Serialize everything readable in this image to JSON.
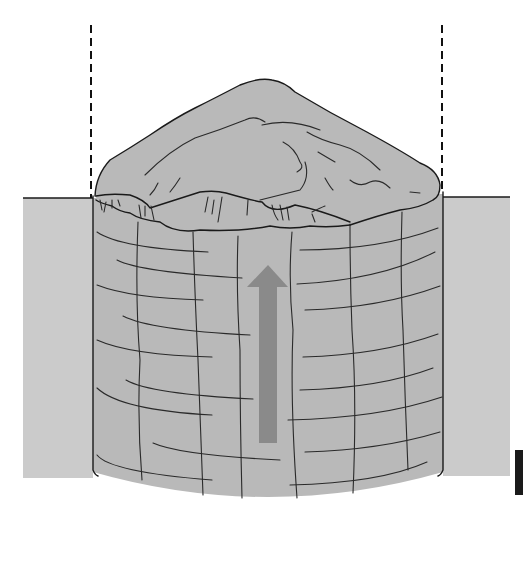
{
  "diagram": {
    "colors": {
      "background": "#ffffff",
      "ground": "#cbcbcb",
      "core_fill": "#b9b9b9",
      "arrow": "#8a8a8a",
      "outline": "#1a1a1a",
      "marker": "#1a1a1a"
    },
    "elements": {
      "left_ground_block": {
        "x": 23,
        "y": 198,
        "w": 70,
        "h": 280
      },
      "right_ground_block": {
        "x": 443,
        "y": 197,
        "w": 67,
        "h": 279
      },
      "core_cylinder": {
        "x_left": 93,
        "x_right": 443,
        "top": 198,
        "bottom_center": 500
      },
      "dashed_guides": [
        {
          "x": 91,
          "y_top": 25,
          "y_bottom": 198
        },
        {
          "x": 442,
          "y_top": 25,
          "y_bottom": 197
        }
      ],
      "arrow": {
        "direction": "up",
        "x_center": 268,
        "tip_y": 265,
        "tail_y": 443
      },
      "corner_marker": {
        "x": 515,
        "y": 450,
        "w": 8,
        "h": 45
      }
    }
  }
}
